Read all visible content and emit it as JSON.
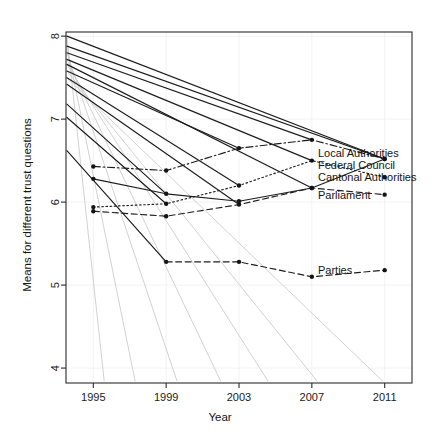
{
  "chart_data": {
    "type": "line",
    "title": "",
    "xlabel": "Year",
    "ylabel": "Means for different trust questions",
    "x": [
      1995,
      1999,
      2003,
      2007,
      2011
    ],
    "xtick_labels": [
      "1995",
      "1999",
      "2003",
      "2007",
      "2011"
    ],
    "ytick_labels": [
      "4",
      "5",
      "6",
      "7",
      "8"
    ],
    "yticks": [
      4,
      5,
      6,
      7,
      8
    ],
    "xlim": [
      1993.5,
      2012.5
    ],
    "ylim": [
      3.82,
      8.05
    ],
    "grid": true,
    "legend_position": "right-inside",
    "series": [
      {
        "name": "Local Authorities",
        "linestyle": "dashdot",
        "values": [
          6.43,
          6.38,
          6.65,
          6.75,
          6.52
        ]
      },
      {
        "name": "Federal Council",
        "linestyle": "solid",
        "values": [
          6.28,
          6.1,
          6.01,
          6.17,
          6.52
        ]
      },
      {
        "name": "Cantonal Authorities",
        "linestyle": "dotted",
        "values": [
          5.94,
          5.98,
          6.2,
          6.5,
          6.3
        ]
      },
      {
        "name": "Parliament",
        "linestyle": "dashed",
        "values": [
          5.89,
          5.83,
          5.97,
          6.17,
          6.09
        ]
      },
      {
        "name": "Parties",
        "linestyle": "dashed",
        "values": [
          null,
          5.28,
          5.28,
          5.1,
          5.18
        ]
      }
    ],
    "legend_entries": [
      {
        "label": "Local Authorities",
        "y_value": 6.52
      },
      {
        "label": "Federal Council",
        "y_value": 6.52
      },
      {
        "label": "Cantonal Authorities",
        "y_value": 6.3
      },
      {
        "label": "Parliament",
        "y_value": 6.09
      },
      {
        "label": "Parties",
        "y_value": 5.18
      }
    ],
    "overlay_fan_lines": {
      "description": "Fan of straight regression-style segments originating near the upper-left axis at high values and descending to the right",
      "origin_year": 1995,
      "origin_values": [
        8.0,
        7.88,
        7.8,
        7.72,
        7.66,
        7.58,
        7.5,
        7.42,
        7.18,
        7.02,
        6.62
      ],
      "dark_endpoints": [
        {
          "year": 2011,
          "value": 6.52
        },
        {
          "year": 2011,
          "value": 6.52
        },
        {
          "year": 2007,
          "value": 6.75
        },
        {
          "year": 2007,
          "value": 6.5
        },
        {
          "year": 2007,
          "value": 6.17
        },
        {
          "year": 2003,
          "value": 6.65
        },
        {
          "year": 2003,
          "value": 6.2
        },
        {
          "year": 2003,
          "value": 5.97
        },
        {
          "year": 1999,
          "value": 6.1
        },
        {
          "year": 1999,
          "value": 5.98
        },
        {
          "year": 1999,
          "value": 5.28
        }
      ],
      "ghost_endpoints": [
        {
          "year": 1995.6,
          "value": 3.84
        },
        {
          "year": 1997.3,
          "value": 3.84
        },
        {
          "year": 1999.6,
          "value": 3.84
        },
        {
          "year": 2002.0,
          "value": 3.84
        },
        {
          "year": 2004.6,
          "value": 3.84
        },
        {
          "year": 2007.3,
          "value": 3.84
        },
        {
          "year": 2010.9,
          "value": 3.84
        }
      ]
    }
  },
  "axes": {
    "x_title": "Year",
    "y_title": "Means for different trust questions"
  }
}
